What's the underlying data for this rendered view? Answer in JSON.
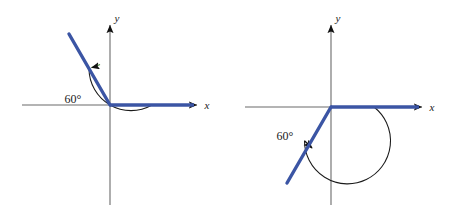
{
  "figure": {
    "background_color": "#ffffff",
    "axis_color": "#6b6b6b",
    "ray_color": "#3b55a4",
    "arc_color": "#1a1a1a",
    "arrow_color": "#111111",
    "arc_highlight_color": "#4a8c3f",
    "panels": [
      {
        "id": "panel-left",
        "name": "angle-120-degrees-standard-position",
        "origin": {
          "x": 110,
          "y": 105
        },
        "x_axis": {
          "label": "x",
          "start_x": 22,
          "end_x": 200,
          "arrow_tip_x": 200
        },
        "y_axis": {
          "label": "y",
          "top_y": 22,
          "bottom_y": 205,
          "arrow_tip_y": 22
        },
        "initial_side": {
          "label": "",
          "angle_deg": 0,
          "length": 88
        },
        "terminal_side": {
          "label": "",
          "angle_deg": 120,
          "length": 82
        },
        "arc": {
          "radius": 42,
          "start_angle_deg": 0,
          "end_angle_deg": 120,
          "direction": "counterclockwise",
          "arrow_at": "end"
        },
        "angle_label": {
          "text": "60°",
          "x": 73,
          "y": 107
        }
      },
      {
        "id": "panel-right",
        "name": "angle-240-degrees-standard-position",
        "origin": {
          "x": 102,
          "y": 107
        },
        "x_axis": {
          "label": "x",
          "start_x": 16,
          "end_x": 196,
          "arrow_tip_x": 196
        },
        "y_axis": {
          "label": "y",
          "top_y": 22,
          "bottom_y": 205,
          "arrow_tip_y": 22
        },
        "initial_side": {
          "label": "",
          "angle_deg": 0,
          "length": 88
        },
        "terminal_side": {
          "label": "",
          "angle_deg": 240,
          "length": 88
        },
        "arc": {
          "radius": 43,
          "start_angle_deg": 0,
          "end_angle_deg": 240,
          "direction": "counterclockwise",
          "arrow_at": "end"
        },
        "angle_label": {
          "text": "60°",
          "x": 56,
          "y": 136
        }
      }
    ]
  }
}
